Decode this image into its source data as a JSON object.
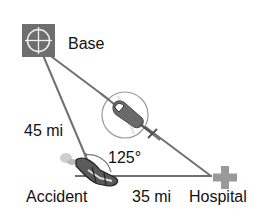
{
  "diagram": {
    "labels": {
      "base": "Base",
      "accident": "Accident",
      "hospital": "Hospital",
      "side_base_accident": "45 mi",
      "side_accident_hospital": "35 mi",
      "angle": "125°"
    },
    "icons": {
      "base": "crosshair-square-icon",
      "hospital": "medical-cross-icon",
      "helicopter": "helicopter-icon",
      "accident": "crashed-car-icon"
    },
    "colors": {
      "base_fill": "#6e6e6e",
      "line": "#707070",
      "hospital_cross": "#9a9a9a",
      "text": "#111111"
    }
  }
}
